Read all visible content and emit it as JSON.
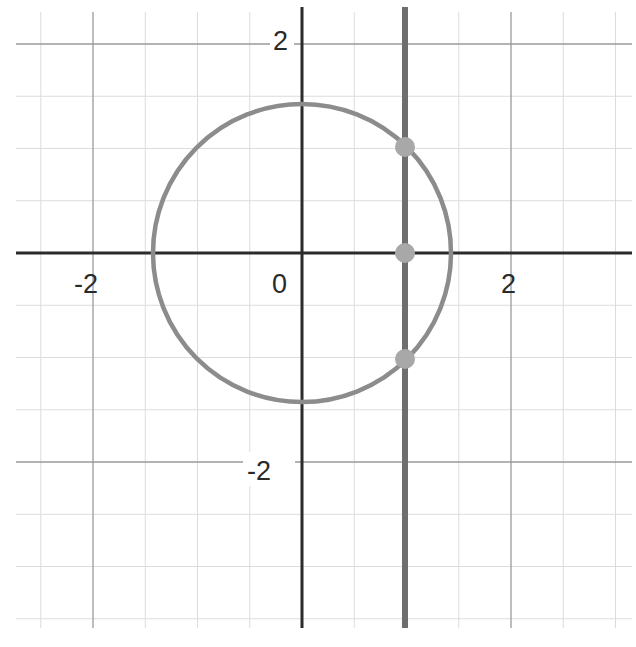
{
  "chart_data": {
    "type": "scatter",
    "title": "",
    "xlabel": "",
    "ylabel": "",
    "xlim": [
      -2.75,
      3.15
    ],
    "ylim": [
      -3.55,
      2.35
    ],
    "grid": true,
    "grid_major_step": 2,
    "grid_minor_step": 0.5,
    "x_tick_labels": [
      "-2",
      "0",
      "2"
    ],
    "y_tick_labels": [
      "2",
      "-2"
    ],
    "curves": [
      {
        "name": "circle",
        "kind": "circle",
        "center": [
          0,
          0
        ],
        "radius": 1.414,
        "color": "#8c8c8c"
      },
      {
        "name": "vertical-line",
        "kind": "vline",
        "x": 1,
        "color": "#6e6e6e"
      }
    ],
    "series": [
      {
        "name": "intersection-points",
        "x": [
          1,
          1,
          1
        ],
        "y": [
          1,
          0,
          -1
        ],
        "color": "#a8a8a8"
      }
    ]
  },
  "colors": {
    "axis": "#2b2b2b",
    "major_grid": "#9a9a9a",
    "minor_grid": "#dcdcdc",
    "circle": "#8c8c8c",
    "vline": "#6e6e6e",
    "point": "#a8a8a8"
  },
  "labels": {
    "x_neg2": "-2",
    "origin": "0",
    "x_pos2": "2",
    "y_pos2": "2",
    "y_neg2": "-2"
  }
}
